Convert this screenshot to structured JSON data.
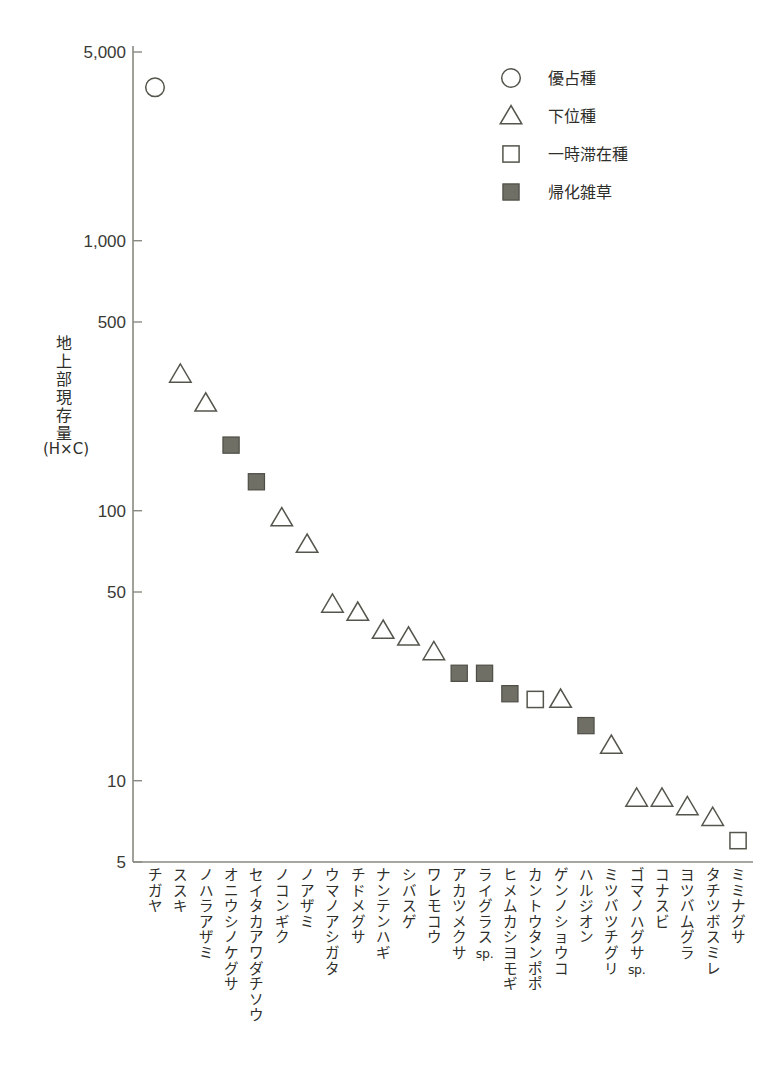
{
  "chart_data": {
    "type": "scatter",
    "title": "",
    "xlabel": "",
    "ylabel": "地上部現存量",
    "ylabel_unit": "(H×C)",
    "yscale": "log",
    "ylim": [
      5,
      5000
    ],
    "ytick_labels": [
      "5,000",
      "1,000",
      "500",
      "100",
      "50",
      "10",
      "5"
    ],
    "ytick_values": [
      5000,
      1000,
      500,
      100,
      50,
      10,
      5
    ],
    "grid": false,
    "legend_position": "top-right",
    "legend": [
      {
        "marker": "circle-open",
        "label": "優占種"
      },
      {
        "marker": "triangle-open",
        "label": "下位種"
      },
      {
        "marker": "square-open",
        "label": "一時滞在種"
      },
      {
        "marker": "square-filled",
        "label": "帰化雑草"
      }
    ],
    "categories": [
      "チガヤ",
      "ススキ",
      "ノハラアザミ",
      "オニウシノケグサ",
      "セイタカアワダチソウ",
      "ノコンギク",
      "ノアザミ",
      "ウマノアシガタ",
      "チドメグサ",
      "ナンテンハギ",
      "シバスゲ",
      "ワレモコウ",
      "アカツメクサ",
      "ライグラス sp.",
      "ヒメムカシヨモギ",
      "カントウタンポポ",
      "ゲンノショウコ",
      "ハルジオン",
      "ミツバツチグリ",
      "ゴマノハグサ sp.",
      "コナスビ",
      "ヨツバムグラ",
      "タチツボスミレ",
      "ミミナグサ"
    ],
    "points": [
      {
        "category": "チガヤ",
        "value": 3700,
        "marker": "circle-open"
      },
      {
        "category": "ススキ",
        "value": 320,
        "marker": "triangle-open"
      },
      {
        "category": "ノハラアザミ",
        "value": 250,
        "marker": "triangle-open"
      },
      {
        "category": "オニウシノケグサ",
        "value": 175,
        "marker": "square-filled"
      },
      {
        "category": "セイタカアワダチソウ",
        "value": 128,
        "marker": "square-filled"
      },
      {
        "category": "ノコンギク",
        "value": 94,
        "marker": "triangle-open"
      },
      {
        "category": "ノアザミ",
        "value": 75,
        "marker": "triangle-open"
      },
      {
        "category": "ウマノアシガタ",
        "value": 45,
        "marker": "triangle-open"
      },
      {
        "category": "チドメグサ",
        "value": 42,
        "marker": "triangle-open"
      },
      {
        "category": "ナンテンハギ",
        "value": 36,
        "marker": "triangle-open"
      },
      {
        "category": "シバスゲ",
        "value": 34,
        "marker": "triangle-open"
      },
      {
        "category": "ワレモコウ",
        "value": 30,
        "marker": "triangle-open"
      },
      {
        "category": "アカツメクサ",
        "value": 25,
        "marker": "square-filled"
      },
      {
        "category": "ライグラス sp.",
        "value": 25,
        "marker": "square-filled"
      },
      {
        "category": "ヒメムカシヨモギ",
        "value": 21,
        "marker": "square-filled"
      },
      {
        "category": "カントウタンポポ",
        "value": 20,
        "marker": "square-open"
      },
      {
        "category": "ゲンノショウコ",
        "value": 20,
        "marker": "triangle-open"
      },
      {
        "category": "ハルジオン",
        "value": 16,
        "marker": "square-filled"
      },
      {
        "category": "ミツバツチグリ",
        "value": 13.5,
        "marker": "triangle-open"
      },
      {
        "category": "ゴマノハグサ sp.",
        "value": 8.6,
        "marker": "triangle-open"
      },
      {
        "category": "コナスビ",
        "value": 8.6,
        "marker": "triangle-open"
      },
      {
        "category": "ヨツバムグラ",
        "value": 8.0,
        "marker": "triangle-open"
      },
      {
        "category": "タチツボスミレ",
        "value": 7.3,
        "marker": "triangle-open"
      },
      {
        "category": "ミミナグサ",
        "value": 6.0,
        "marker": "square-open"
      }
    ],
    "colors": {
      "axis": "#8a8a82",
      "marker_stroke": "#55554d",
      "marker_fill": "#6f6f66",
      "text": "#2e2e2a",
      "background": "#ffffff"
    }
  }
}
